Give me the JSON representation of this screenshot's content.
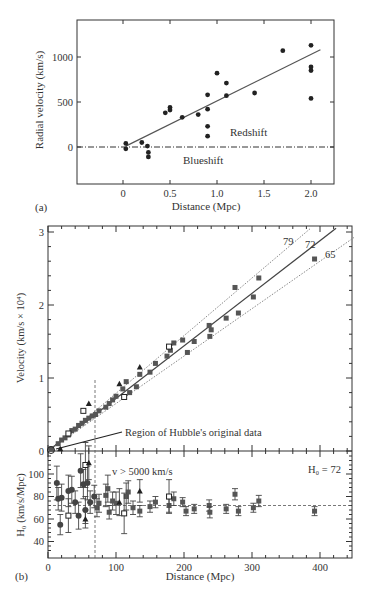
{
  "chart_data": [
    {
      "panel": "(a)",
      "type": "scatter",
      "title": "",
      "xlabel": "Distance (Mpc)",
      "ylabel": "Radial velocity (km/s)",
      "xticks": [
        "0",
        "0.5",
        "1.0",
        "1.5",
        "2.0"
      ],
      "yticks": [
        "0",
        "500",
        "1000"
      ],
      "xlim": [
        -0.48,
        2.25
      ],
      "ylim": [
        -410,
        1400
      ],
      "annotations": [
        "Redshift",
        "Blueshift"
      ],
      "fit_line": {
        "x": [
          0.03,
          2.1
        ],
        "y": [
          10,
          1080
        ]
      },
      "zero_line": "dash-dot at y=0",
      "points": [
        {
          "x": 0.03,
          "y": 40
        },
        {
          "x": 0.03,
          "y": -20
        },
        {
          "x": 0.2,
          "y": 50
        },
        {
          "x": 0.26,
          "y": 10
        },
        {
          "x": 0.27,
          "y": -60
        },
        {
          "x": 0.27,
          "y": -110
        },
        {
          "x": 0.45,
          "y": 380
        },
        {
          "x": 0.5,
          "y": 440
        },
        {
          "x": 0.5,
          "y": 410
        },
        {
          "x": 0.63,
          "y": 330
        },
        {
          "x": 0.8,
          "y": 360
        },
        {
          "x": 0.9,
          "y": 580
        },
        {
          "x": 0.9,
          "y": 420
        },
        {
          "x": 0.9,
          "y": 230
        },
        {
          "x": 0.9,
          "y": 120
        },
        {
          "x": 1.0,
          "y": 820
        },
        {
          "x": 1.1,
          "y": 710
        },
        {
          "x": 1.1,
          "y": 570
        },
        {
          "x": 1.4,
          "y": 600
        },
        {
          "x": 1.7,
          "y": 1070
        },
        {
          "x": 2.0,
          "y": 1130
        },
        {
          "x": 2.0,
          "y": 890
        },
        {
          "x": 2.0,
          "y": 850
        },
        {
          "x": 2.0,
          "y": 540
        }
      ],
      "panel_label": "(a)"
    },
    {
      "panel": "(b) upper",
      "type": "scatter",
      "xlabel": "",
      "ylabel": "Velocity (km/s × 10⁴)",
      "yticks": [
        "0",
        "1",
        "2",
        "3"
      ],
      "xlim": [
        0,
        450
      ],
      "ylim": [
        0,
        3.05
      ],
      "lines": [
        {
          "label": "79",
          "slope_km_s_per_Mpc": 79,
          "style": "dotted"
        },
        {
          "label": "72",
          "slope_km_s_per_Mpc": 72,
          "style": "solid"
        },
        {
          "label": "65",
          "slope_km_s_per_Mpc": 65,
          "style": "dotted"
        }
      ],
      "annotation": "Region of Hubble's original data",
      "vline_x": 70,
      "points": [
        {
          "x": 5,
          "y": 0.03
        },
        {
          "x": 15,
          "y": 0.1
        },
        {
          "x": 20,
          "y": 0.15
        },
        {
          "x": 25,
          "y": 0.18
        },
        {
          "x": 30,
          "y": 0.22
        },
        {
          "x": 35,
          "y": 0.28
        },
        {
          "x": 40,
          "y": 0.3
        },
        {
          "x": 45,
          "y": 0.35
        },
        {
          "x": 50,
          "y": 0.38
        },
        {
          "x": 55,
          "y": 0.42
        },
        {
          "x": 60,
          "y": 0.45
        },
        {
          "x": 65,
          "y": 0.48
        },
        {
          "x": 70,
          "y": 0.5
        },
        {
          "x": 75,
          "y": 0.55
        },
        {
          "x": 85,
          "y": 0.6
        },
        {
          "x": 90,
          "y": 0.65
        },
        {
          "x": 95,
          "y": 0.7
        },
        {
          "x": 100,
          "y": 0.75
        },
        {
          "x": 110,
          "y": 0.85
        },
        {
          "x": 115,
          "y": 0.95
        },
        {
          "x": 120,
          "y": 0.8
        },
        {
          "x": 130,
          "y": 0.88
        },
        {
          "x": 135,
          "y": 1.05
        },
        {
          "x": 150,
          "y": 1.08
        },
        {
          "x": 158,
          "y": 1.2
        },
        {
          "x": 175,
          "y": 1.3
        },
        {
          "x": 180,
          "y": 1.38
        },
        {
          "x": 185,
          "y": 1.48
        },
        {
          "x": 198,
          "y": 1.52
        },
        {
          "x": 205,
          "y": 1.35
        },
        {
          "x": 215,
          "y": 1.5
        },
        {
          "x": 237,
          "y": 1.72
        },
        {
          "x": 238,
          "y": 1.57
        },
        {
          "x": 240,
          "y": 1.66
        },
        {
          "x": 262,
          "y": 1.82
        },
        {
          "x": 275,
          "y": 2.24
        },
        {
          "x": 280,
          "y": 1.89
        },
        {
          "x": 302,
          "y": 2.11
        },
        {
          "x": 310,
          "y": 2.37
        },
        {
          "x": 392,
          "y": 2.63
        }
      ],
      "open_squares": [
        {
          "x": 30,
          "y": 0.24
        },
        {
          "x": 52,
          "y": 0.55
        },
        {
          "x": 112,
          "y": 0.74
        },
        {
          "x": 178,
          "y": 1.43
        }
      ],
      "triangles": [
        {
          "x": 18,
          "y": 0.03
        },
        {
          "x": 60,
          "y": 0.65
        },
        {
          "x": 105,
          "y": 0.92
        },
        {
          "x": 135,
          "y": 1.15
        }
      ]
    },
    {
      "panel": "(b) lower",
      "type": "scatter",
      "xlabel": "Distance (Mpc)",
      "ylabel": "H₀ (km/s/Mpc)",
      "xticks": [
        "0",
        "100",
        "200",
        "300",
        "400"
      ],
      "yticks": [
        "40",
        "60",
        "80",
        "100"
      ],
      "xlim": [
        0,
        450
      ],
      "ylim": [
        30,
        118
      ],
      "hline_y": 72,
      "vline_x": 70,
      "annotations": [
        "v > 5000 km/s",
        "H₀ = 72"
      ],
      "points": [
        {
          "x": 13,
          "y": 92,
          "err": 15
        },
        {
          "x": 15,
          "y": 78,
          "err": 10
        },
        {
          "x": 18,
          "y": 55,
          "err": 9
        },
        {
          "x": 20,
          "y": 79,
          "err": 12
        },
        {
          "x": 30,
          "y": 85,
          "err": 14
        },
        {
          "x": 35,
          "y": 86,
          "err": 12
        },
        {
          "x": 40,
          "y": 75,
          "err": 10
        },
        {
          "x": 45,
          "y": 63,
          "err": 12
        },
        {
          "x": 48,
          "y": 103,
          "err": 15
        },
        {
          "x": 52,
          "y": 91,
          "err": 13
        },
        {
          "x": 55,
          "y": 68,
          "err": 12
        },
        {
          "x": 58,
          "y": 92,
          "err": 15
        },
        {
          "x": 62,
          "y": 75,
          "err": 10
        },
        {
          "x": 68,
          "y": 80,
          "err": 10
        },
        {
          "x": 72,
          "y": 70,
          "err": 8
        },
        {
          "x": 75,
          "y": 74,
          "err": 8
        },
        {
          "x": 85,
          "y": 81,
          "err": 10
        },
        {
          "x": 88,
          "y": 87,
          "err": 12
        },
        {
          "x": 90,
          "y": 66,
          "err": 6
        },
        {
          "x": 95,
          "y": 76,
          "err": 8
        },
        {
          "x": 100,
          "y": 74,
          "err": 10
        },
        {
          "x": 115,
          "y": 80,
          "err": 12
        },
        {
          "x": 118,
          "y": 84,
          "err": 10
        },
        {
          "x": 125,
          "y": 70,
          "err": 6
        },
        {
          "x": 135,
          "y": 67,
          "err": 5
        },
        {
          "x": 150,
          "y": 71,
          "err": 5
        },
        {
          "x": 158,
          "y": 75,
          "err": 5
        },
        {
          "x": 178,
          "y": 72,
          "err": 6
        },
        {
          "x": 185,
          "y": 78,
          "err": 6
        },
        {
          "x": 198,
          "y": 75,
          "err": 4
        },
        {
          "x": 203,
          "y": 67,
          "err": 4
        },
        {
          "x": 215,
          "y": 69,
          "err": 4
        },
        {
          "x": 237,
          "y": 72,
          "err": 5
        },
        {
          "x": 238,
          "y": 66,
          "err": 5
        },
        {
          "x": 262,
          "y": 69,
          "err": 4
        },
        {
          "x": 275,
          "y": 82,
          "err": 5
        },
        {
          "x": 280,
          "y": 67,
          "err": 4
        },
        {
          "x": 302,
          "y": 70,
          "err": 4
        },
        {
          "x": 310,
          "y": 76,
          "err": 5
        },
        {
          "x": 392,
          "y": 67,
          "err": 4
        }
      ],
      "open_squares": [
        {
          "x": 30,
          "y": 63,
          "err": 15
        },
        {
          "x": 55,
          "y": 108,
          "err": 20
        },
        {
          "x": 112,
          "y": 65,
          "err": 18
        },
        {
          "x": 178,
          "y": 80,
          "err": 15
        }
      ],
      "triangles": [
        {
          "x": 55,
          "y": 60,
          "err": 8
        },
        {
          "x": 60,
          "y": 110,
          "err": 15
        },
        {
          "x": 105,
          "y": 75,
          "err": 12
        },
        {
          "x": 135,
          "y": 85,
          "err": 10
        }
      ],
      "panel_label": "(b)"
    }
  ]
}
